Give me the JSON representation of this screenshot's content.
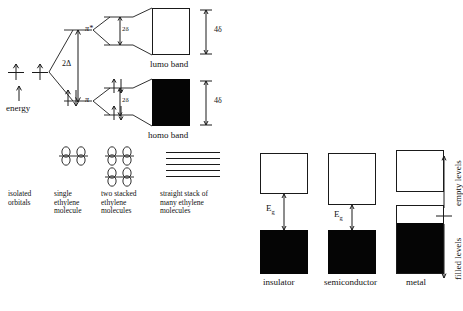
{
  "diagram": {
    "title_present": false,
    "left_panel": {
      "energy_axis_label": "energy",
      "splitting_label": "2Δ",
      "pi_label": "π",
      "pi_star_label": "π*",
      "delta_split_label": "2δ",
      "band_width_label": "4δ",
      "lumo_band_label": "lumo band",
      "homo_band_label": "homo band",
      "captions": [
        "isolated\norbitals",
        "single\nethylene\nmolecule",
        "two stacked\nethylene\nmolecules",
        "straight stack of\nmany ethylene\nmolecules"
      ],
      "stack_line_count": 5,
      "isolated_level_count": 2,
      "isolated_electrons_per_level": 1
    },
    "right_panel": {
      "columns": [
        {
          "name": "insulator",
          "gap_label": "E",
          "gap_sub": "g",
          "gap_size": "large",
          "valence_fill": "full",
          "conduction_fill": "empty"
        },
        {
          "name": "semiconductor",
          "gap_label": "E",
          "gap_sub": "g",
          "gap_size": "small",
          "valence_fill": "full",
          "conduction_fill": "empty"
        },
        {
          "name": "metal",
          "gap_label": "",
          "gap_sub": "",
          "gap_size": "none",
          "valence_fill": "partial",
          "conduction_fill": "empty"
        }
      ],
      "axis_top_label": "empty levels",
      "axis_bottom_label": "filled levels"
    },
    "colors": {
      "ink": "#1a1a1a",
      "filled_band": "#050505",
      "empty_band": "#ffffff",
      "page": "#ffffff"
    }
  }
}
